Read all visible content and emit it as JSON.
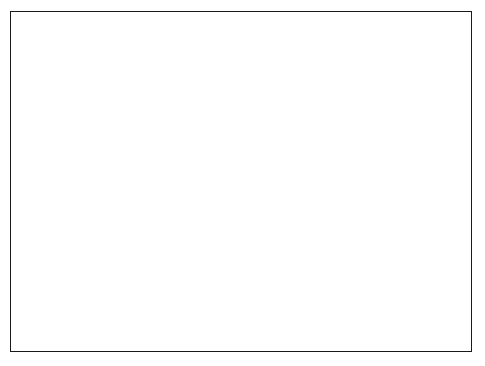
{
  "figure": {
    "type": "map",
    "background": "#ffffff",
    "frame_color": "#1a1a1a",
    "width": 485,
    "height": 366
  },
  "map_labels": [
    {
      "name": "taushima",
      "text": "Taushima",
      "x": 57,
      "y": 55,
      "style": "place"
    },
    {
      "name": "japan-sea",
      "text": "Japan Sea",
      "x": 145,
      "y": 45,
      "style": "sea"
    },
    {
      "name": "tottori",
      "text": "Tottori",
      "x": 324,
      "y": 34,
      "style": "place"
    },
    {
      "name": "tango",
      "text": "Tango",
      "x": 387,
      "y": 36,
      "style": "place"
    },
    {
      "name": "shikoku",
      "text": "Shikoku",
      "x": 255,
      "y": 244,
      "style": "place"
    },
    {
      "name": "kyushu",
      "text": "Kyushu",
      "x": 138,
      "y": 280,
      "style": "place"
    },
    {
      "name": "pacific-ocean",
      "text": "Pacific Ocean",
      "x": 168,
      "y": 312,
      "style": "sea"
    }
  ],
  "compass": {
    "label": "N",
    "label_x": 308,
    "label_y": 247,
    "center_x": 299,
    "center_y": 296,
    "radius": 6.5,
    "needle_from": [
      299,
      296
    ],
    "needle_to": [
      311,
      256
    ]
  },
  "legend": {
    "entries": [
      {
        "name": "legend-positive-small",
        "symbol": "open-circle",
        "radius": 7.2,
        "cx": 359,
        "cy": 257,
        "label": "+ 10",
        "exponent": "−5",
        "label_x": 382,
        "label_y": 253
      },
      {
        "name": "legend-negative",
        "symbol": "filled-circle",
        "radius": 11.3,
        "cx": 359,
        "cy": 290,
        "label": "− 5·10",
        "exponent": "−6",
        "label_x": 379,
        "label_y": 286
      },
      {
        "name": "legend-positive-large",
        "symbol": "open-circle",
        "radius": 16.5,
        "cx": 359,
        "cy": 329,
        "label": "+10",
        "exponent": "−4",
        "label_x": 381,
        "label_y": 325
      }
    ]
  },
  "chart_data": {
    "type": "scatter",
    "title": "",
    "symbol_encoding": {
      "filled": "negative",
      "open": "positive",
      "size": "magnitude"
    },
    "markers": [
      {
        "x": 37,
        "y": 86,
        "r": 14.0,
        "fill": "filled"
      },
      {
        "x": 64,
        "y": 98,
        "r": 2.6,
        "fill": "filled"
      },
      {
        "x": 120,
        "y": 101,
        "r": 2.4,
        "fill": "filled"
      },
      {
        "x": 118,
        "y": 135,
        "r": 2.6,
        "fill": "filled"
      },
      {
        "x": 102,
        "y": 146,
        "r": 1.9,
        "fill": "filled"
      },
      {
        "x": 174,
        "y": 99,
        "r": 5.2,
        "fill": "filled"
      },
      {
        "x": 195,
        "y": 99,
        "r": 4.7,
        "fill": "filled"
      },
      {
        "x": 199,
        "y": 126,
        "r": 5.0,
        "fill": "filled"
      },
      {
        "x": 235,
        "y": 98,
        "r": 5.0,
        "fill": "filled"
      },
      {
        "x": 252,
        "y": 82,
        "r": 7.6,
        "fill": "filled"
      },
      {
        "x": 271,
        "y": 82,
        "r": 7.4,
        "fill": "filled"
      },
      {
        "x": 286,
        "y": 56,
        "r": 8.2,
        "fill": "filled"
      },
      {
        "x": 302,
        "y": 60,
        "r": 4.0,
        "fill": "filled"
      },
      {
        "x": 290,
        "y": 93,
        "r": 6.0,
        "fill": "filled"
      },
      {
        "x": 310,
        "y": 93,
        "r": 5.4,
        "fill": "filled"
      },
      {
        "x": 318,
        "y": 76,
        "r": 3.6,
        "fill": "filled"
      },
      {
        "x": 316,
        "y": 70,
        "r": 2.0,
        "fill": "open"
      },
      {
        "x": 315,
        "y": 122,
        "r": 5.8,
        "fill": "filled"
      },
      {
        "x": 327,
        "y": 119,
        "r": 4.3,
        "fill": "filled"
      },
      {
        "x": 300,
        "y": 140,
        "r": 3.0,
        "fill": "filled"
      },
      {
        "x": 262,
        "y": 138,
        "r": 2.7,
        "fill": "filled"
      },
      {
        "x": 299,
        "y": 135,
        "r": 5.3,
        "fill": "filled"
      },
      {
        "x": 339,
        "y": 99,
        "r": 2.5,
        "fill": "filled"
      },
      {
        "x": 337,
        "y": 65,
        "r": 2.5,
        "fill": "open"
      },
      {
        "x": 344,
        "y": 73,
        "r": 6.0,
        "fill": "filled"
      },
      {
        "x": 346,
        "y": 59,
        "r": 6.5,
        "fill": "open"
      },
      {
        "x": 358,
        "y": 57,
        "r": 7.6,
        "fill": "open"
      },
      {
        "x": 357,
        "y": 78,
        "r": 6.4,
        "fill": "open"
      },
      {
        "x": 355,
        "y": 99,
        "r": 5.2,
        "fill": "filled"
      },
      {
        "x": 373,
        "y": 55,
        "r": 8.6,
        "fill": "filled"
      },
      {
        "x": 388,
        "y": 61,
        "r": 4.6,
        "fill": "filled"
      },
      {
        "x": 399,
        "y": 58,
        "r": 4.6,
        "fill": "filled"
      },
      {
        "x": 407,
        "y": 65,
        "r": 4.4,
        "fill": "filled"
      },
      {
        "x": 392,
        "y": 72,
        "r": 4.6,
        "fill": "filled"
      },
      {
        "x": 404,
        "y": 76,
        "r": 5.4,
        "fill": "filled"
      },
      {
        "x": 419,
        "y": 72,
        "r": 4.2,
        "fill": "filled"
      },
      {
        "x": 428,
        "y": 73,
        "r": 3.2,
        "fill": "filled"
      },
      {
        "x": 413,
        "y": 85,
        "r": 3.4,
        "fill": "filled"
      },
      {
        "x": 424,
        "y": 89,
        "r": 5.0,
        "fill": "filled"
      },
      {
        "x": 399,
        "y": 92,
        "r": 2.6,
        "fill": "filled"
      },
      {
        "x": 376,
        "y": 96,
        "r": 2.5,
        "fill": "filled"
      },
      {
        "x": 385,
        "y": 118,
        "r": 2.6,
        "fill": "filled"
      },
      {
        "x": 404,
        "y": 118,
        "r": 4.0,
        "fill": "filled"
      },
      {
        "x": 434,
        "y": 98,
        "r": 3.5,
        "fill": "open"
      },
      {
        "x": 447,
        "y": 118,
        "r": 5.0,
        "fill": "open"
      },
      {
        "x": 423,
        "y": 131,
        "r": 2.6,
        "fill": "open"
      },
      {
        "x": 347,
        "y": 119,
        "r": 3.4,
        "fill": "filled"
      },
      {
        "x": 310,
        "y": 162,
        "r": 5.0,
        "fill": "filled"
      },
      {
        "x": 330,
        "y": 157,
        "r": 4.6,
        "fill": "filled"
      },
      {
        "x": 371,
        "y": 153,
        "r": 7.0,
        "fill": "filled"
      },
      {
        "x": 355,
        "y": 158,
        "r": 3.0,
        "fill": "filled"
      },
      {
        "x": 392,
        "y": 162,
        "r": 5.6,
        "fill": "filled"
      },
      {
        "x": 406,
        "y": 160,
        "r": 7.6,
        "fill": "filled"
      },
      {
        "x": 430,
        "y": 156,
        "r": 2.5,
        "fill": "filled"
      },
      {
        "x": 454,
        "y": 156,
        "r": 4.5,
        "fill": "open"
      },
      {
        "x": 424,
        "y": 143,
        "r": 2.6,
        "fill": "open"
      },
      {
        "x": 264,
        "y": 162,
        "r": 5.2,
        "fill": "filled"
      },
      {
        "x": 281,
        "y": 164,
        "r": 6.0,
        "fill": "filled"
      },
      {
        "x": 293,
        "y": 160,
        "r": 5.2,
        "fill": "filled"
      },
      {
        "x": 316,
        "y": 174,
        "r": 4.6,
        "fill": "filled"
      },
      {
        "x": 340,
        "y": 163,
        "r": 3.0,
        "fill": "filled"
      },
      {
        "x": 362,
        "y": 176,
        "r": 4.8,
        "fill": "filled"
      },
      {
        "x": 388,
        "y": 178,
        "r": 5.0,
        "fill": "filled"
      },
      {
        "x": 375,
        "y": 186,
        "r": 5.6,
        "fill": "filled"
      },
      {
        "x": 409,
        "y": 186,
        "r": 2.6,
        "fill": "filled"
      },
      {
        "x": 299,
        "y": 186,
        "r": 2.0,
        "fill": "filled"
      },
      {
        "x": 254,
        "y": 141,
        "r": 3.0,
        "fill": "filled"
      },
      {
        "x": 244,
        "y": 121,
        "r": 5.2,
        "fill": "open"
      },
      {
        "x": 274,
        "y": 121,
        "r": 5.4,
        "fill": "open"
      },
      {
        "x": 236,
        "y": 127,
        "r": 2.0,
        "fill": "open"
      },
      {
        "x": 208,
        "y": 127,
        "r": 2.2,
        "fill": "open"
      },
      {
        "x": 224,
        "y": 130,
        "r": 2.0,
        "fill": "open"
      },
      {
        "x": 210,
        "y": 97,
        "r": 6.0,
        "fill": "open"
      },
      {
        "x": 212,
        "y": 127,
        "r": 2.4,
        "fill": "open"
      },
      {
        "x": 176,
        "y": 132,
        "r": 2.4,
        "fill": "open"
      },
      {
        "x": 165,
        "y": 124,
        "r": 3.4,
        "fill": "open"
      },
      {
        "x": 158,
        "y": 113,
        "r": 5.4,
        "fill": "open"
      },
      {
        "x": 140,
        "y": 113,
        "r": 3.4,
        "fill": "open"
      },
      {
        "x": 130,
        "y": 120,
        "r": 2.4,
        "fill": "open"
      },
      {
        "x": 40,
        "y": 134,
        "r": 6.6,
        "fill": "open"
      },
      {
        "x": 59,
        "y": 137,
        "r": 5.0,
        "fill": "open"
      },
      {
        "x": 72,
        "y": 132,
        "r": 3.2,
        "fill": "open"
      },
      {
        "x": 44,
        "y": 155,
        "r": 4.6,
        "fill": "open"
      },
      {
        "x": 33,
        "y": 153,
        "r": 2.4,
        "fill": "open"
      },
      {
        "x": 57,
        "y": 161,
        "r": 2.4,
        "fill": "open"
      },
      {
        "x": 90,
        "y": 146,
        "r": 2.0,
        "fill": "open"
      },
      {
        "x": 79,
        "y": 157,
        "r": 3.4,
        "fill": "open"
      },
      {
        "x": 95,
        "y": 163,
        "r": 4.0,
        "fill": "open"
      },
      {
        "x": 113,
        "y": 158,
        "r": 2.4,
        "fill": "open"
      },
      {
        "x": 130,
        "y": 155,
        "r": 2.2,
        "fill": "open"
      },
      {
        "x": 149,
        "y": 152,
        "r": 2.0,
        "fill": "open"
      },
      {
        "x": 116,
        "y": 176,
        "r": 4.2,
        "fill": "open"
      },
      {
        "x": 97,
        "y": 181,
        "r": 2.6,
        "fill": "open"
      },
      {
        "x": 78,
        "y": 173,
        "r": 2.6,
        "fill": "open"
      },
      {
        "x": 63,
        "y": 180,
        "r": 3.8,
        "fill": "open"
      },
      {
        "x": 50,
        "y": 188,
        "r": 4.2,
        "fill": "open"
      },
      {
        "x": 35,
        "y": 190,
        "r": 2.8,
        "fill": "open"
      },
      {
        "x": 68,
        "y": 200,
        "r": 3.8,
        "fill": "open"
      },
      {
        "x": 86,
        "y": 193,
        "r": 4.2,
        "fill": "open"
      },
      {
        "x": 104,
        "y": 196,
        "r": 4.4,
        "fill": "open"
      },
      {
        "x": 130,
        "y": 182,
        "r": 4.2,
        "fill": "open"
      },
      {
        "x": 150,
        "y": 172,
        "r": 4.6,
        "fill": "open"
      },
      {
        "x": 168,
        "y": 175,
        "r": 5.0,
        "fill": "open"
      },
      {
        "x": 186,
        "y": 169,
        "r": 3.2,
        "fill": "open"
      },
      {
        "x": 188,
        "y": 191,
        "r": 4.0,
        "fill": "open"
      },
      {
        "x": 171,
        "y": 199,
        "r": 3.6,
        "fill": "open"
      },
      {
        "x": 152,
        "y": 196,
        "r": 3.4,
        "fill": "open"
      },
      {
        "x": 132,
        "y": 204,
        "r": 5.0,
        "fill": "open"
      },
      {
        "x": 113,
        "y": 213,
        "r": 4.2,
        "fill": "open"
      },
      {
        "x": 93,
        "y": 214,
        "r": 3.6,
        "fill": "open"
      },
      {
        "x": 73,
        "y": 218,
        "r": 5.2,
        "fill": "open"
      },
      {
        "x": 53,
        "y": 215,
        "r": 4.6,
        "fill": "open"
      },
      {
        "x": 40,
        "y": 209,
        "r": 5.8,
        "fill": "open"
      },
      {
        "x": 63,
        "y": 228,
        "r": 5.6,
        "fill": "open"
      },
      {
        "x": 89,
        "y": 235,
        "r": 5.6,
        "fill": "open"
      },
      {
        "x": 124,
        "y": 237,
        "r": 4.0,
        "fill": "open"
      },
      {
        "x": 120,
        "y": 221,
        "r": 5.2,
        "fill": "open"
      },
      {
        "x": 143,
        "y": 214,
        "r": 3.2,
        "fill": "open"
      },
      {
        "x": 164,
        "y": 207,
        "r": 2.8,
        "fill": "open"
      },
      {
        "x": 196,
        "y": 212,
        "r": 4.4,
        "fill": "open"
      },
      {
        "x": 216,
        "y": 205,
        "r": 4.0,
        "fill": "open"
      },
      {
        "x": 233,
        "y": 201,
        "r": 4.4,
        "fill": "open"
      },
      {
        "x": 250,
        "y": 197,
        "r": 2.4,
        "fill": "open"
      },
      {
        "x": 228,
        "y": 219,
        "r": 4.2,
        "fill": "open"
      },
      {
        "x": 210,
        "y": 225,
        "r": 2.8,
        "fill": "open"
      },
      {
        "x": 252,
        "y": 212,
        "r": 2.8,
        "fill": "open"
      },
      {
        "x": 264,
        "y": 205,
        "r": 4.6,
        "fill": "filled"
      },
      {
        "x": 288,
        "y": 210,
        "r": 2.6,
        "fill": "open"
      },
      {
        "x": 310,
        "y": 200,
        "r": 4.0,
        "fill": "open"
      },
      {
        "x": 240,
        "y": 246,
        "r": 4.6,
        "fill": "open"
      },
      {
        "x": 222,
        "y": 244,
        "r": 5.0,
        "fill": "filled"
      },
      {
        "x": 199,
        "y": 234,
        "r": 3.4,
        "fill": "filled"
      },
      {
        "x": 109,
        "y": 245,
        "r": 2.6,
        "fill": "open"
      },
      {
        "x": 76,
        "y": 245,
        "r": 2.8,
        "fill": "open"
      },
      {
        "x": 68,
        "y": 261,
        "r": 2.8,
        "fill": "open"
      },
      {
        "x": 46,
        "y": 268,
        "r": 3.6,
        "fill": "open"
      },
      {
        "x": 67,
        "y": 271,
        "r": 4.6,
        "fill": "open"
      },
      {
        "x": 84,
        "y": 278,
        "r": 2.2,
        "fill": "open"
      },
      {
        "x": 105,
        "y": 277,
        "r": 3.4,
        "fill": "filled"
      },
      {
        "x": 36,
        "y": 288,
        "r": 3.2,
        "fill": "filled"
      },
      {
        "x": 50,
        "y": 310,
        "r": 3.2,
        "fill": "filled"
      },
      {
        "x": 76,
        "y": 315,
        "r": 3.2,
        "fill": "filled"
      },
      {
        "x": 433,
        "y": 186,
        "r": 2.2,
        "fill": "filled"
      },
      {
        "x": 444,
        "y": 197,
        "r": 4.4,
        "fill": "open"
      },
      {
        "x": 460,
        "y": 181,
        "r": 2.0,
        "fill": "filled"
      },
      {
        "x": 457,
        "y": 199,
        "r": 4.6,
        "fill": "open"
      },
      {
        "x": 428,
        "y": 212,
        "r": 4.4,
        "fill": "open"
      },
      {
        "x": 444,
        "y": 213,
        "r": 5.0,
        "fill": "open"
      },
      {
        "x": 459,
        "y": 212,
        "r": 4.2,
        "fill": "open"
      },
      {
        "x": 413,
        "y": 209,
        "r": 2.4,
        "fill": "open"
      },
      {
        "x": 410,
        "y": 195,
        "r": 2.6,
        "fill": "filled"
      },
      {
        "x": 394,
        "y": 202,
        "r": 2.4,
        "fill": "open"
      }
    ]
  }
}
